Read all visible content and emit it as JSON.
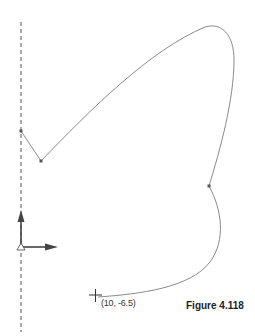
{
  "figure": {
    "caption": "Figure 4.118",
    "type": "cad-sketch",
    "background": "#ffffff"
  },
  "sketch": {
    "line_color": "#8a8a8a",
    "centerline_color": "#555555",
    "axis_color": "#555555",
    "points": [
      {
        "id": "A",
        "label": "start point on centerline"
      },
      {
        "id": "B",
        "label": "line endpoint"
      },
      {
        "id": "C",
        "label": "spline midpoint"
      },
      {
        "id": "D",
        "label": "spline endpoint at cursor"
      }
    ],
    "segments": [
      {
        "from": "A",
        "to": "B",
        "kind": "line"
      },
      {
        "from": "B",
        "to": "C",
        "kind": "spline"
      },
      {
        "from": "C",
        "to": "D",
        "kind": "spline"
      }
    ]
  },
  "centerline": {
    "style": "dashed",
    "orientation": "vertical"
  },
  "origin_axes": {
    "x_arrow": "x-axis-arrow",
    "y_arrow": "y-axis-arrow"
  },
  "cursor": {
    "icon": "crosshair-icon",
    "coordinate_label": "(10, -6.5)"
  }
}
